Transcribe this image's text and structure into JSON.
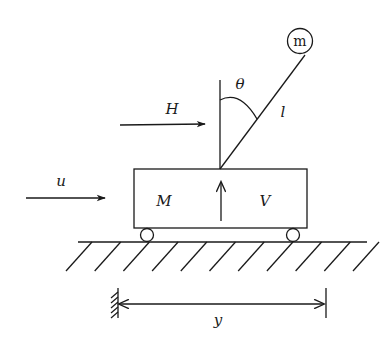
{
  "diagram": {
    "colors": {
      "ink": "#1a1a1a",
      "background": "#ffffff"
    },
    "labels": {
      "pendulum_mass": "m",
      "angle": "θ",
      "length": "l",
      "horizontal_force": "H",
      "input_force": "u",
      "cart_mass": "M",
      "vertical_force": "V",
      "displacement": "y"
    },
    "components": [
      {
        "id": "cart",
        "label": "M"
      },
      {
        "id": "pendulum-rod",
        "label": "l"
      },
      {
        "id": "pendulum-bob",
        "label": "m"
      },
      {
        "id": "ground",
        "label": ""
      },
      {
        "id": "displacement-dimension",
        "label": "y"
      }
    ],
    "arrows": [
      {
        "id": "input-force",
        "label": "u",
        "direction": "right"
      },
      {
        "id": "horizontal-reaction",
        "label": "H",
        "direction": "right"
      },
      {
        "id": "vertical-reaction",
        "label": "V",
        "direction": "up"
      },
      {
        "id": "displacement",
        "label": "y",
        "direction": "both"
      }
    ]
  }
}
